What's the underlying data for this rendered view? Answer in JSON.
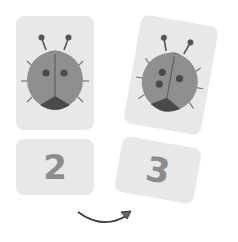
{
  "cards": {
    "left_picture": {
      "icon": "ladybug-icon",
      "spots": 2
    },
    "left_number": {
      "label": "2"
    },
    "right_picture": {
      "icon": "ladybug-icon",
      "spots": 3
    },
    "right_number": {
      "label": "3"
    }
  },
  "arrow": {
    "icon": "curved-arrow-right-icon"
  },
  "colors": {
    "card": "#e8e8e8",
    "body": "#8f8f8f",
    "dark": "#4a4a4a",
    "number": "#8c8c8c"
  }
}
